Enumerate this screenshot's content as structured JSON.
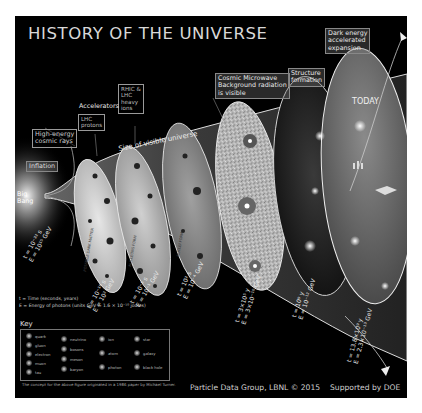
{
  "title": "HISTORY OF THE UNIVERSE",
  "labels": {
    "dark_energy": [
      "Dark energy",
      "accelerated",
      "expansion"
    ],
    "structure": [
      "Structure",
      "formation"
    ],
    "cmb": [
      "Cosmic Microwave",
      "Background radiation",
      "is visible"
    ],
    "rhic": [
      "RHIC &",
      "LHC",
      "heavy",
      "ions"
    ],
    "accelerators": "Accelerators",
    "lhc_protons": [
      "LHC",
      "protons"
    ],
    "cosmic_rays": [
      "High-energy",
      "cosmic rays"
    ],
    "inflation": "Inflation",
    "big_bang": [
      "Big",
      "Bang"
    ],
    "size": "Size of visible universe",
    "today": "TODAY",
    "stage_texts": [
      "POSSIBLE DARK MATTER",
      "NUCLEONS FORM",
      "NUCLEI FORM"
    ]
  },
  "timeline": [
    {
      "t": "t = 10⁻³² s",
      "E": "E = 10¹⁵ GeV"
    },
    {
      "t": "t = 10⁻¹⁰ s",
      "E": "E = 10² GeV"
    },
    {
      "t": "t = 10⁻⁵ s",
      "E": "E = 10⁻¹ GeV"
    },
    {
      "t": "t = 10² s",
      "E": "E = 10⁻⁴ GeV"
    },
    {
      "t": "t = 3×10⁵ y",
      "E": "E = 3×10⁻¹⁰ GeV"
    },
    {
      "t": "t = 10⁹ y",
      "E": "E = 10⁻¹² GeV"
    },
    {
      "t": "t = 13.8×10⁹ y",
      "E": "E = 2.3×10⁻¹³ GeV"
    }
  ],
  "legend_notes": {
    "time": "t = Time (seconds, years)",
    "energy": "E = Energy of photons (units GeV = 1.6 × 10⁻¹⁰ joules)"
  },
  "key": {
    "title": "Key",
    "items": [
      "quark",
      "gluon",
      "electron",
      "muon",
      "tau",
      "neutrino",
      "bosons",
      "meson",
      "baryon",
      "ion",
      "atom",
      "photon",
      "star",
      "galaxy",
      "black hole"
    ],
    "caption": "The concept for the above figure originated in a 1986 paper by Michael Turner."
  },
  "credits": {
    "pdg": "Particle Data Group, LBNL © 2015",
    "doe": "Supported by DOE"
  }
}
